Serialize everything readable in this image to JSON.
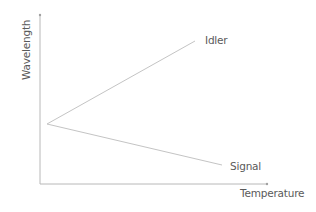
{
  "diagram": {
    "y_axis_label": "Wavelength",
    "x_axis_label": "Temperature",
    "series": [
      {
        "name": "Idler",
        "trend": "increasing"
      },
      {
        "name": "Signal",
        "trend": "decreasing"
      }
    ],
    "colors": {
      "axis": "#b8b8b8",
      "line": "#c4c4c4",
      "text": "#5a5a5a"
    }
  }
}
